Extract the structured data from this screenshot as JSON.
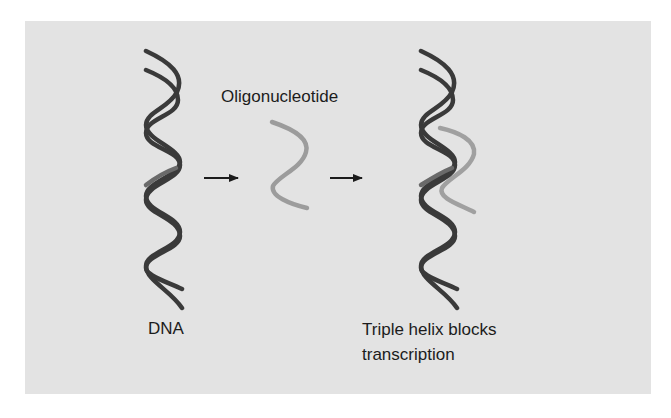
{
  "figure": {
    "labels": {
      "oligonucleotide": "Oligonucleotide",
      "dna": "DNA",
      "triple_helix_line1": "Triple helix blocks",
      "triple_helix_line2": "transcription"
    },
    "steps": [
      {
        "name": "DNA double helix"
      },
      {
        "name": "Oligonucleotide strand"
      },
      {
        "name": "Triple helix"
      }
    ],
    "colors": {
      "background_panel": "#e3e3e3",
      "dna_strand": "#3a3a3a",
      "oligo_strand": "#9c9c9c",
      "text": "#1c1c1c",
      "arrow": "#1c1c1c"
    }
  }
}
